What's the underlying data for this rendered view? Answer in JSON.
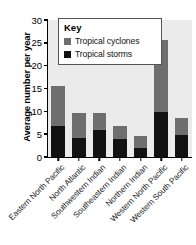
{
  "chart_data": {
    "type": "bar",
    "subtype": "stacked-vertical",
    "title": "",
    "xlabel": "",
    "ylabel": "Average number per year",
    "ylim": [
      0,
      30
    ],
    "ytick_values": [
      0,
      5,
      10,
      15,
      20,
      25,
      30
    ],
    "ytick_labels": [
      "0",
      "5",
      "10",
      "15",
      "20",
      "25",
      "30"
    ],
    "grid": false,
    "legend_position": "upper-left-inside",
    "legend_title": "Key",
    "categories": [
      "Eastern North Pacific",
      "North Atlantic",
      "Southwestern Indian",
      "Southeastern Indian",
      "Northern Indian",
      "Western North Pacific",
      "Western South Pacific"
    ],
    "series": [
      {
        "name": "Tropical storms",
        "color": "#121212",
        "values": [
          6.9,
          4.1,
          5.9,
          3.9,
          1.9,
          9.8,
          4.9
        ]
      },
      {
        "name": "Tropical cyclones",
        "color": "#6e6e6e",
        "values": [
          8.6,
          5.6,
          3.8,
          2.8,
          2.7,
          15.9,
          3.7
        ]
      }
    ],
    "totals": [
      15.5,
      9.7,
      9.7,
      6.7,
      4.6,
      25.7,
      8.6
    ],
    "plot_background": "#ebebeb",
    "axis_color": "#000000"
  },
  "legend": {
    "title": "Key",
    "entries": [
      {
        "label": "Tropical cyclones",
        "color": "#6e6e6e"
      },
      {
        "label": "Tropical storms",
        "color": "#121212"
      }
    ]
  }
}
